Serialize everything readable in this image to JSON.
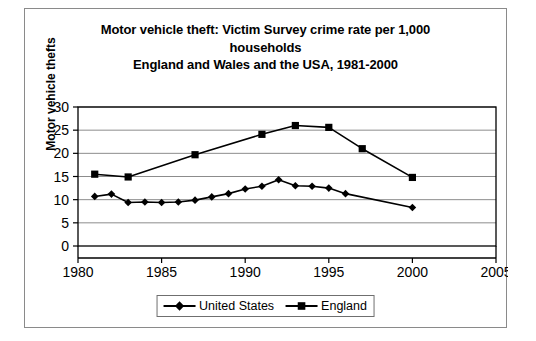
{
  "chart_data": {
    "type": "line",
    "title": "Motor vehicle theft: Victim Survey crime rate per 1,000 households England and Wales and the USA, 1981-2000",
    "title_lines": [
      "Motor vehicle theft: Victim Survey crime rate per 1,000",
      "households",
      "England and Wales and the USA, 1981-2000"
    ],
    "xlabel": "",
    "ylabel": "Motor vehicle thefts",
    "xlim": [
      1980,
      2005
    ],
    "ylim": [
      0,
      30
    ],
    "xticks": [
      1980,
      1985,
      1990,
      1995,
      2000,
      2005
    ],
    "yticks": [
      0,
      5,
      10,
      15,
      20,
      25,
      30
    ],
    "xtick_labels": [
      "1980",
      "1985",
      "1990",
      "1995",
      "2000",
      "2005"
    ],
    "ytick_labels": [
      "0",
      "5",
      "10",
      "15",
      "20",
      "25",
      "30"
    ],
    "grid": "horizontal",
    "legend_position": "bottom-center",
    "series": [
      {
        "name": "United States",
        "marker": "diamond",
        "color": "#000000",
        "x": [
          1981,
          1982,
          1983,
          1984,
          1985,
          1986,
          1987,
          1988,
          1989,
          1990,
          1991,
          1992,
          1993,
          1994,
          1995,
          1996,
          2000
        ],
        "values": [
          10.7,
          11.2,
          9.4,
          9.5,
          9.4,
          9.5,
          9.9,
          10.6,
          11.3,
          12.3,
          12.9,
          14.3,
          13.0,
          12.9,
          12.5,
          11.3,
          8.3
        ]
      },
      {
        "name": "England",
        "marker": "square",
        "color": "#000000",
        "x": [
          1981,
          1983,
          1987,
          1991,
          1993,
          1995,
          1997,
          2000
        ],
        "values": [
          15.5,
          14.9,
          19.7,
          24.1,
          26.0,
          25.6,
          21.0,
          14.8
        ]
      }
    ]
  },
  "legend": {
    "items": [
      {
        "label": "United States",
        "marker": "diamond"
      },
      {
        "label": "England",
        "marker": "square"
      }
    ]
  }
}
